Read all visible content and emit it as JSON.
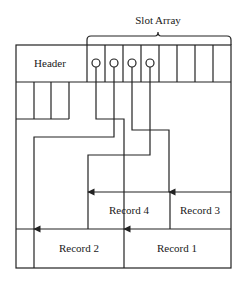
{
  "diagram": {
    "type": "slotted-page",
    "labels": {
      "slot_array": "Slot Array",
      "header": "Header",
      "records": [
        {
          "id": "record-1",
          "label": "Record 1"
        },
        {
          "id": "record-2",
          "label": "Record 2"
        },
        {
          "id": "record-3",
          "label": "Record 3"
        },
        {
          "id": "record-4",
          "label": "Record 4"
        }
      ]
    },
    "slots": {
      "count": 8,
      "filled": 4
    },
    "connections": [
      {
        "from": "slot-1",
        "to": "Record 1"
      },
      {
        "from": "slot-2",
        "to": "Record 2"
      },
      {
        "from": "slot-3",
        "to": "Record 3"
      },
      {
        "from": "slot-4",
        "to": "Record 4"
      }
    ],
    "colors": {
      "line": "#222222",
      "background": "#ffffff"
    }
  }
}
